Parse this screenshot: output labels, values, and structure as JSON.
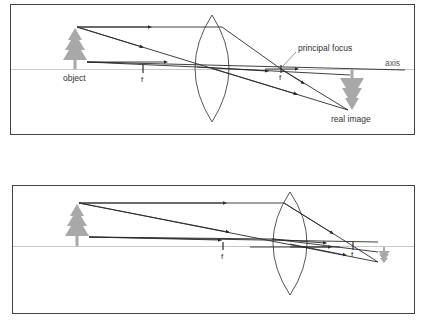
{
  "diagrams": [
    {
      "name": "converging-lens-object-beyond-2f",
      "labels": {
        "object": "object",
        "focus_left": "f",
        "focus_right": "f",
        "principal_focus": "principal focus",
        "axis": "axis",
        "real_image": "real image"
      }
    },
    {
      "name": "converging-lens-object-far",
      "labels": {
        "focus_left": "f",
        "focus_right": "f"
      }
    }
  ],
  "colors": {
    "frame": "#444444",
    "ray": "#2a2a2a",
    "lens": "#555555",
    "axis": "#c8c8c8",
    "tree": "#a8a8a8",
    "text": "#333333"
  }
}
